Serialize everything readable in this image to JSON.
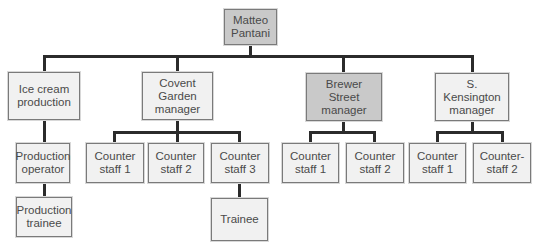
{
  "chart": {
    "type": "org-chart",
    "colors": {
      "highlight_fill": "#c9c9c9",
      "default_fill": "#f1f1f1",
      "connector": "#2b2b2b"
    },
    "root": {
      "label": "Matteo\nPantani",
      "highlighted": true
    },
    "level1": [
      {
        "label": "Ice cream\nproduction",
        "highlighted": false
      },
      {
        "label": "Covent\nGarden\nmanager",
        "highlighted": false
      },
      {
        "label": "Brewer\nStreet\nmanager",
        "highlighted": true
      },
      {
        "label": "S. Kensington\nmanager",
        "highlighted": false
      }
    ],
    "ice_cream": {
      "operator": "Production\noperator",
      "trainee": "Production\ntrainee"
    },
    "covent_garden": {
      "staff": [
        "Counter\nstaff 1",
        "Counter\nstaff 2",
        "Counter\nstaff 3"
      ],
      "trainee": "Trainee"
    },
    "brewer_street": {
      "staff": [
        "Counter\nstaff 1",
        "Counter\nstaff 2"
      ]
    },
    "kensington": {
      "staff": [
        "Counter\nstaff 1",
        "Counter-\nstaff 2"
      ]
    }
  }
}
